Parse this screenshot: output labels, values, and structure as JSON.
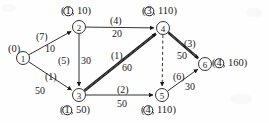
{
  "figure": {
    "type": "directed-weighted-graph",
    "background_color": "#fefefe",
    "stroke_color": "#1a1a1a"
  },
  "nodes": [
    {
      "id": "1",
      "x": 23,
      "y": 58,
      "r": 6.5,
      "label": "(0)",
      "label_x": 8,
      "label_y": 44,
      "label_has_circle": false
    },
    {
      "id": "2",
      "x": 79,
      "y": 27,
      "r": 6.5,
      "label": "10",
      "label_x": 61,
      "label_y": 6,
      "label_has_circle": true,
      "label_circle_num": "1",
      "label_open": "(",
      "label_sep": ",",
      "label_close": ")"
    },
    {
      "id": "3",
      "x": 79,
      "y": 95,
      "r": 6.5,
      "label": "50",
      "label_x": 60,
      "label_y": 105,
      "label_has_circle": true,
      "label_circle_num": "1",
      "label_open": "(",
      "label_sep": ",",
      "label_close": ")"
    },
    {
      "id": "4",
      "x": 163,
      "y": 28,
      "r": 6.5,
      "label": "110",
      "label_x": 142,
      "label_y": 6,
      "label_has_circle": true,
      "label_circle_num": "3",
      "label_open": "(",
      "label_sep": ",",
      "label_close": ")"
    },
    {
      "id": "5",
      "x": 162,
      "y": 95,
      "r": 6.5,
      "label": "110",
      "label_x": 141,
      "label_y": 105,
      "label_has_circle": true,
      "label_circle_num": "4",
      "label_open": "(",
      "label_sep": ",",
      "label_close": ")"
    },
    {
      "id": "6",
      "x": 205,
      "y": 64,
      "r": 6.5,
      "label": "160",
      "label_x": 212,
      "label_y": 58,
      "label_has_circle": true,
      "label_circle_num": "4",
      "label_open": "(",
      "label_sep": ",",
      "label_close": ")"
    }
  ],
  "edges": [
    {
      "id": "e12",
      "from": "1",
      "to": "2",
      "cost": "(7)",
      "weight": "10",
      "style": "solid",
      "bold": false,
      "cost_x": 36,
      "cost_y": 32,
      "weight_x": 45,
      "weight_y": 44
    },
    {
      "id": "e13",
      "from": "1",
      "to": "3",
      "cost": "(1)",
      "weight": "50",
      "style": "solid",
      "bold": false,
      "cost_x": 45,
      "cost_y": 72,
      "weight_x": 35,
      "weight_y": 86
    },
    {
      "id": "e23",
      "from": "2",
      "to": "3",
      "cost": "(5)",
      "weight": "30",
      "style": "solid",
      "bold": false,
      "cost_x": 58,
      "cost_y": 56,
      "weight_x": 81,
      "weight_y": 56
    },
    {
      "id": "e24",
      "from": "2",
      "to": "4",
      "cost": "(4)",
      "weight": "20",
      "style": "solid",
      "bold": false,
      "cost_x": 110,
      "cost_y": 16,
      "weight_x": 112,
      "weight_y": 29
    },
    {
      "id": "e34",
      "from": "3",
      "to": "4",
      "cost": "(1)",
      "weight": "60",
      "style": "solid",
      "bold": true,
      "cost_x": 111,
      "cost_y": 51,
      "weight_x": 122,
      "weight_y": 63
    },
    {
      "id": "e35",
      "from": "3",
      "to": "5",
      "cost": "(2)",
      "weight": "50",
      "style": "solid",
      "bold": false,
      "cost_x": 117,
      "cost_y": 85,
      "weight_x": 117,
      "weight_y": 99
    },
    {
      "id": "e46",
      "from": "4",
      "to": "6",
      "cost": "(3)",
      "weight": "50",
      "style": "solid",
      "bold": true,
      "cost_x": 184,
      "cost_y": 39,
      "weight_x": 177,
      "weight_y": 51
    },
    {
      "id": "e56",
      "from": "5",
      "to": "6",
      "cost": "(6)",
      "weight": "30",
      "style": "solid",
      "bold": false,
      "cost_x": 173,
      "cost_y": 72,
      "weight_x": 185,
      "weight_y": 82
    },
    {
      "id": "e45",
      "from": "4",
      "to": "5",
      "cost": "",
      "weight": "",
      "style": "dashed",
      "bold": false,
      "cost_x": 0,
      "cost_y": 0,
      "weight_x": 0,
      "weight_y": 0
    }
  ]
}
